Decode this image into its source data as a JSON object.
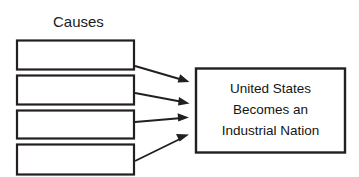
{
  "diagram": {
    "title": "Causes",
    "background_color": "#ffffff",
    "stroke_color": "#231f20",
    "text_color": "#1b1b1b",
    "causes": [
      {
        "label": "",
        "index": 1
      },
      {
        "label": "",
        "index": 2
      },
      {
        "label": "",
        "index": 3
      },
      {
        "label": "",
        "index": 4
      }
    ],
    "effect": {
      "line1": "United States",
      "line2": "Becomes an",
      "line3": "Industrial Nation"
    },
    "arrows": [
      {
        "from": "cause-box-1",
        "to": "effect-box"
      },
      {
        "from": "cause-box-2",
        "to": "effect-box"
      },
      {
        "from": "cause-box-3",
        "to": "effect-box"
      },
      {
        "from": "cause-box-4",
        "to": "effect-box"
      }
    ]
  }
}
